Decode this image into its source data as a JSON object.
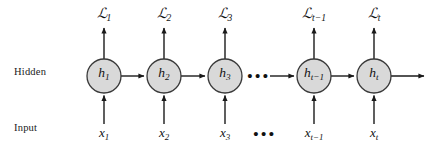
{
  "diagram": {
    "type": "rnn-unrolled-computational-graph",
    "background_color": "#ffffff",
    "node_fill_color": "#d9d9d9",
    "node_stroke_color": "#3a3a3a",
    "arrow_color": "#1a1a1a",
    "text_color": "#111111",
    "row_labels": {
      "hidden": "Hidden",
      "input": "Input"
    },
    "node_radius": 17,
    "hidden_row_y": 76,
    "loss_row_y": 15,
    "input_row_y": 134,
    "timesteps": [
      {
        "index": 1,
        "x": 104,
        "loss_label": "ℒ",
        "loss_sub": "1",
        "hidden_label": "h",
        "hidden_sub": "1",
        "input_label": "x",
        "input_sub": "1",
        "has_loss_arrow": true,
        "has_input_arrow": true,
        "has_recurrent_out": true
      },
      {
        "index": 2,
        "x": 164,
        "loss_label": "ℒ",
        "loss_sub": "2",
        "hidden_label": "h",
        "hidden_sub": "2",
        "input_label": "x",
        "input_sub": "2",
        "has_loss_arrow": true,
        "has_input_arrow": true,
        "has_recurrent_out": true
      },
      {
        "index": 3,
        "x": 225,
        "loss_label": "ℒ",
        "loss_sub": "3",
        "hidden_label": "h",
        "hidden_sub": "3",
        "input_label": "x",
        "input_sub": "3",
        "has_loss_arrow": true,
        "has_input_arrow": true,
        "has_recurrent_out": false
      },
      {
        "index": 4,
        "x": 314,
        "loss_label": "ℒ",
        "loss_sub": "t−1",
        "hidden_label": "h",
        "hidden_sub": "t−1",
        "input_label": "x",
        "input_sub": "t−1",
        "has_loss_arrow": true,
        "has_input_arrow": true,
        "has_recurrent_out": true
      },
      {
        "index": 5,
        "x": 374,
        "loss_label": "ℒ",
        "loss_sub": "t",
        "hidden_label": "h",
        "hidden_sub": "t",
        "input_label": "x",
        "input_sub": "t",
        "has_loss_arrow": true,
        "has_input_arrow": true,
        "has_recurrent_out": true
      }
    ],
    "ellipses": [
      {
        "name": "hidden-ellipsis",
        "x": 259,
        "glyph": "•••"
      },
      {
        "name": "input-ellipsis",
        "x": 265,
        "glyph": "•••"
      }
    ],
    "recurrent_arrow_note": "horizontal arrows flow left-to-right between hidden states",
    "terminal_arrow": {
      "from_x": 391,
      "to_x": 424,
      "y": 76
    }
  }
}
